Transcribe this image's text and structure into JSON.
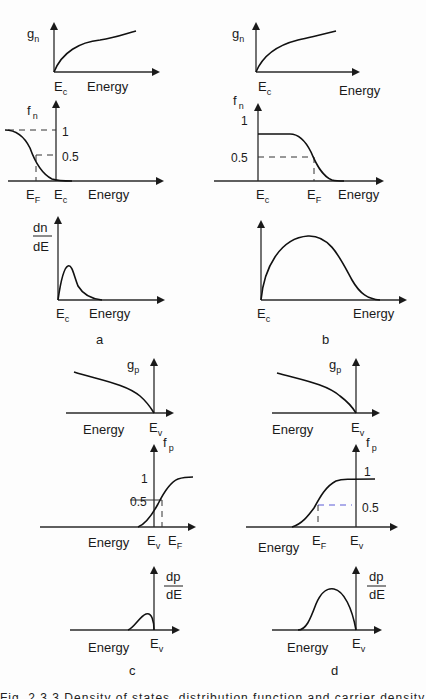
{
  "figure": {
    "panels": {
      "a": {
        "label": "a",
        "g": {
          "ylabel": "g",
          "ysub": "n",
          "xlabel": "Energy",
          "edge": "E",
          "edge_sub": "c"
        },
        "f": {
          "ylabel": "f",
          "ysub": "n",
          "xlabel": "Energy",
          "tick_1": "1",
          "tick_half": "0.5",
          "ef": "E",
          "ef_sub": "F",
          "edge": "E",
          "edge_sub": "c"
        },
        "d": {
          "ylabel_num": "dn",
          "ylabel_den": "dE",
          "xlabel": "Energy",
          "edge": "E",
          "edge_sub": "c"
        }
      },
      "b": {
        "label": "b",
        "g": {
          "ylabel": "g",
          "ysub": "n",
          "xlabel": "Energy",
          "edge": "E",
          "edge_sub": "c"
        },
        "f": {
          "ylabel": "f",
          "ysub": "n",
          "xlabel": "Energy",
          "tick_1": "1",
          "tick_half": "0.5",
          "ef": "E",
          "ef_sub": "F",
          "edge": "E",
          "edge_sub": "c"
        },
        "d": {
          "xlabel": "Energy",
          "edge": "E",
          "edge_sub": "c"
        }
      },
      "c": {
        "label": "c",
        "g": {
          "ylabel": "g",
          "ysub": "p",
          "xlabel": "Energy",
          "edge": "E",
          "edge_sub": "v"
        },
        "f": {
          "ylabel": "f",
          "ysub": "p",
          "xlabel": "Energy",
          "tick_1": "1",
          "tick_half": "0.5",
          "ef": "E",
          "ef_sub": "F",
          "edge": "E",
          "edge_sub": "v"
        },
        "d": {
          "ylabel_num": "dp",
          "ylabel_den": "dE",
          "xlabel": "Energy",
          "edge": "E",
          "edge_sub": "v"
        }
      },
      "d": {
        "label": "d",
        "g": {
          "ylabel": "g",
          "ysub": "p",
          "xlabel": "Energy",
          "edge": "E",
          "edge_sub": "v"
        },
        "f": {
          "ylabel": "f",
          "ysub": "p",
          "xlabel": "Energy",
          "tick_1": "1",
          "tick_half": "0.5",
          "ef": "E",
          "ef_sub": "F",
          "edge": "E",
          "edge_sub": "v"
        },
        "d": {
          "ylabel_num": "dp",
          "ylabel_den": "dE",
          "xlabel": "Energy",
          "edge": "E",
          "edge_sub": "v"
        }
      }
    },
    "caption": "Fig. 2.3.3  Density of states, distribution function and carrier density vs energy"
  }
}
